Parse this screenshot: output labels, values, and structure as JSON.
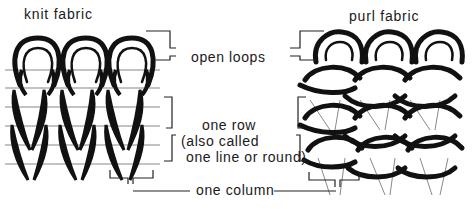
{
  "titles": {
    "knit": "knit fabric",
    "purl": "purl fabric"
  },
  "labels": {
    "open_loops": "open loops",
    "row_line1": "one row",
    "row_line2": "(also called",
    "row_line3": "one line or round)",
    "column": "one column"
  },
  "colors": {
    "ink": "#111111",
    "background": "#ffffff"
  }
}
